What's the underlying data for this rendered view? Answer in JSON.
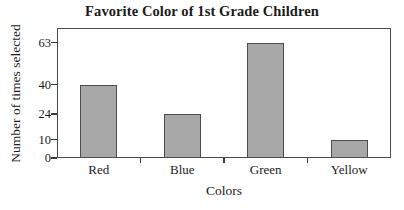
{
  "chart_data": {
    "type": "bar",
    "title": "Favorite Color of 1st Grade Children",
    "xlabel": "Colors",
    "ylabel": "Number of times selected",
    "categories": [
      "Red",
      "Blue",
      "Green",
      "Yellow"
    ],
    "values": [
      40,
      24,
      63,
      10
    ],
    "yticks": [
      0,
      10,
      24,
      40,
      63
    ],
    "ytick_labels": [
      "0",
      "10",
      "24",
      "40",
      "63"
    ],
    "ylim": [
      0,
      71
    ],
    "xlim_categories": 4,
    "grid": false,
    "legend": null,
    "bar_color": "#a8a8a8",
    "bar_border_color": "#4d4d4d",
    "frame_color": "#4a4a4a",
    "background_color": "#ffffff",
    "bars": [
      {
        "category": "Red",
        "value": 40,
        "label": "40"
      },
      {
        "category": "Blue",
        "value": 24,
        "label": "24"
      },
      {
        "category": "Green",
        "value": 63,
        "label": "63"
      },
      {
        "category": "Yellow",
        "value": 10,
        "label": "10"
      }
    ]
  }
}
